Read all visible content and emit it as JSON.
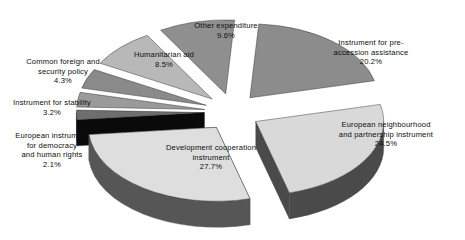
{
  "chart_data": {
    "type": "pie",
    "title": "",
    "subtitle": "",
    "xlabel": "",
    "ylabel": "",
    "legend_position": "none",
    "grid": false,
    "exploded": true,
    "three_d": true,
    "value_unit": "percent",
    "categories": [
      "Instrument for pre-accession assistance",
      "European neighbourhood and partnership instrument",
      "Development cooperation instrument",
      "European instrument for democracy and human rights",
      "Instrument for stability",
      "Common foreign and security policy",
      "Humanitarian aid",
      "Other expenditure"
    ],
    "values": [
      20.2,
      24.5,
      27.7,
      2.1,
      3.2,
      4.3,
      8.5,
      9.6
    ],
    "slices": [
      {
        "label": "Instrument for pre-accession assistance",
        "label_lines": [
          "Instrument for pre-",
          "accession assistance"
        ],
        "value": 20.2,
        "pct_text": "20.2%",
        "top_color": "#8c8c8c",
        "side_color": "#0a0a0a",
        "label_x": 312,
        "label_y": 38,
        "label_w": 118
      },
      {
        "label": "European neighbourhood and partnership instrument",
        "label_lines": [
          "European neighbourhood",
          "and partnership instrument"
        ],
        "value": 24.5,
        "pct_text": "24.5%",
        "top_color": "#d9d9d9",
        "side_color": "#4a4a4a",
        "label_x": 318,
        "label_y": 120,
        "label_w": 136
      },
      {
        "label": "Development cooperation instrument",
        "label_lines": [
          "Development cooperation",
          "instrument"
        ],
        "value": 27.7,
        "pct_text": "27.7%",
        "top_color": "#dedede",
        "side_color": "#565656",
        "label_x": 147,
        "label_y": 143,
        "label_w": 128
      },
      {
        "label": "European instrument for democracy and human rights",
        "label_lines": [
          "European instrument",
          "for democracy",
          "and human rights"
        ],
        "value": 2.1,
        "pct_text": "2.1%",
        "top_color": "#6e6e6e",
        "side_color": "#0a0a0a",
        "label_x": 4,
        "label_y": 131,
        "label_w": 96
      },
      {
        "label": "Instrument for stability",
        "label_lines": [
          "Instrument for stability"
        ],
        "value": 3.2,
        "pct_text": "3.2%",
        "top_color": "#9a9a9a",
        "side_color": "#0a0a0a",
        "label_x": 2,
        "label_y": 98,
        "label_w": 100
      },
      {
        "label": "Common foreign and security policy",
        "label_lines": [
          "Common foreign and",
          "security policy"
        ],
        "value": 4.3,
        "pct_text": "4.3%",
        "top_color": "#8a8a8a",
        "side_color": "#0a0a0a",
        "label_x": 12,
        "label_y": 57,
        "label_w": 102
      },
      {
        "label": "Humanitarian aid",
        "label_lines": [
          "Humanitarian aid"
        ],
        "value": 8.5,
        "pct_text": "8.5%",
        "top_color": "#b8b8b8",
        "side_color": "#0a0a0a",
        "label_x": 120,
        "label_y": 50,
        "label_w": 88
      },
      {
        "label": "Other expenditure",
        "label_lines": [
          "Other expenditure",
          ""
        ],
        "value": 9.6,
        "pct_text": "9.6%",
        "top_color": "#8f8f8f",
        "side_color": "#0a0a0a",
        "label_x": 180,
        "label_y": 21,
        "label_w": 92
      }
    ]
  },
  "colors": {
    "background": "#ffffff",
    "text": "#0d0d0d",
    "dark_side": "#0a0a0a",
    "mid_gray": "#8c8c8c",
    "light_gray": "#dedede"
  }
}
